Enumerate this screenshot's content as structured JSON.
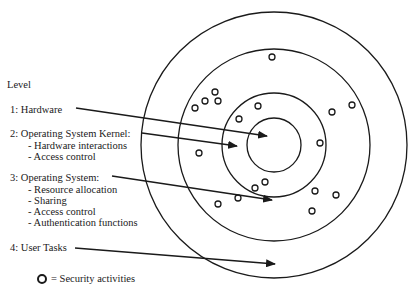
{
  "diagram": {
    "heading": "Level",
    "levels": [
      {
        "label": "1:  Hardware",
        "items": []
      },
      {
        "label": "2:  Operating System Kernel:",
        "items": [
          "- Hardware interactions",
          "- Access control"
        ]
      },
      {
        "label": "3:  Operating System:",
        "items": [
          "- Resource allocation",
          "- Sharing",
          "- Access control",
          "- Authentication functions"
        ]
      },
      {
        "label": "4:  User Tasks",
        "items": []
      }
    ],
    "legend": {
      "symbol": "security-activity-circle-icon",
      "text": "= Security activities"
    },
    "rings": [
      {
        "cx": 274,
        "cy": 145,
        "r": 27
      },
      {
        "cx": 274,
        "cy": 145,
        "r": 52
      },
      {
        "cx": 274,
        "cy": 145,
        "r": 96
      },
      {
        "cx": 274,
        "cy": 145,
        "r": 133
      }
    ],
    "arrows": [
      {
        "from": [
          76,
          108
        ],
        "to": [
          267,
          136
        ],
        "level": 1
      },
      {
        "from": [
          142,
          133
        ],
        "to": [
          237,
          146
        ],
        "level": 2
      },
      {
        "from": [
          112,
          176
        ],
        "to": [
          272,
          200
        ],
        "level": 3
      },
      {
        "from": [
          75,
          248
        ],
        "to": [
          275,
          264
        ],
        "level": 4
      }
    ],
    "security_dots": [
      [
        272,
        57
      ],
      [
        195,
        108
      ],
      [
        205,
        101
      ],
      [
        215,
        92
      ],
      [
        218,
        101
      ],
      [
        258,
        106
      ],
      [
        239,
        119
      ],
      [
        352,
        105
      ],
      [
        332,
        112
      ],
      [
        320,
        143
      ],
      [
        199,
        153
      ],
      [
        218,
        204
      ],
      [
        238,
        198
      ],
      [
        255,
        188
      ],
      [
        265,
        182
      ],
      [
        315,
        191
      ],
      [
        336,
        195
      ],
      [
        312,
        211
      ]
    ],
    "colors": {
      "line": "#1a1a1a",
      "background": "#ffffff"
    }
  }
}
